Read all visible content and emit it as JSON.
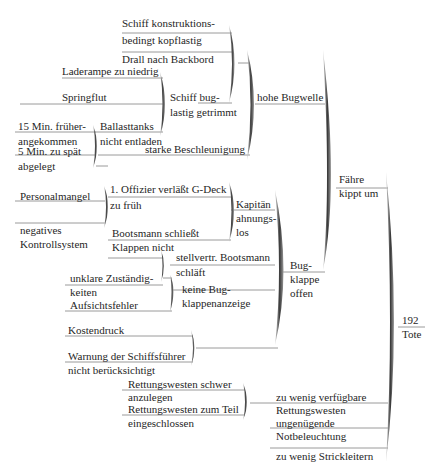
{
  "diagram": {
    "type": "cause-effect-tree",
    "root": "192 Tote",
    "nodes": {
      "n1": "Schiff konstruktions-",
      "n1b": "bedingt kopflastig",
      "n2": "Drall nach Backbord",
      "n3": "Laderampe zu niedrig",
      "n4": "Springflut",
      "n5a": "Schiff bug-",
      "n5b": "lastig getrimmt",
      "n6a": "15 Min. früher-",
      "n6b": "angekommen",
      "n7a": "5 Min. zu spät",
      "n7b": "abgelegt",
      "n8a": "Ballasttanks",
      "n8b": "nicht entladen",
      "n9": "starke Beschleunigung",
      "n10": "hohe Bugwelle",
      "n11": "Personalmangel",
      "n12a": "1. Offizier verläßt G-Deck",
      "n12b": "zu früh",
      "n13a": "negatives",
      "n13b": "Kontrollsystem",
      "n14a": "Bootsmann schließt",
      "n14b": "Klappen nicht",
      "n15a": "Kapitän",
      "n15b": "ahnungs-",
      "n15c": "los",
      "n16a": "stellvertr. Bootsmann",
      "n16b": "schläft",
      "n17a": "unklare Zuständig-",
      "n17b": "keiten",
      "n18": "Aufsichtsfehler",
      "n19a": "keine Bug-",
      "n19b": "klappenanzeige",
      "n20a": "Bug-",
      "n20b": "klappe",
      "n20c": "offen",
      "n21": "Kostendruck",
      "n22a": "Warnung der Schiffsführer",
      "n22b": "nicht berücksichtigt",
      "n23a": "Fähre",
      "n23b": "kippt um",
      "n24a": "Rettungswesten schwer",
      "n24b": "anzulegen",
      "n25a": "Rettungswesten zum Teil",
      "n25b": "eingeschlossen",
      "n26a": "zu wenig verfügbare",
      "n26b": "Rettungswesten",
      "n27a": "ungenügende",
      "n27b": "Notbeleuchtung",
      "n28": "zu wenig Strickleitern",
      "root_a": "192",
      "root_b": "Tote"
    },
    "colors": {
      "line": "#9a9a9a",
      "brace_dark": "#2a2a2a",
      "brace_light": "#bdbdbd",
      "text": "#262626"
    }
  }
}
